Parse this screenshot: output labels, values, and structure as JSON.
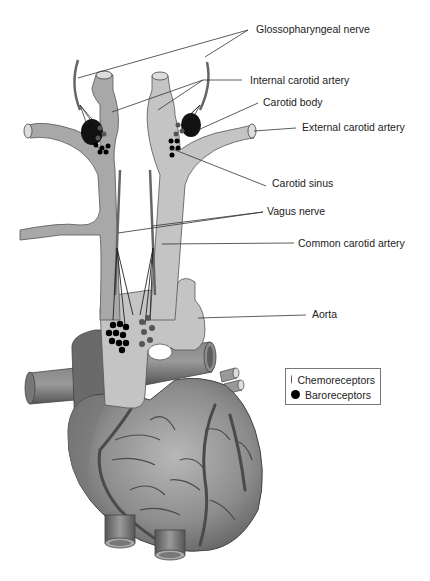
{
  "labels": {
    "glossopharyngeal": "Glossopharyngeal nerve",
    "internal_carotid": "Internal carotid artery",
    "carotid_body": "Carotid body",
    "external_carotid": "External carotid artery",
    "carotid_sinus": "Carotid sinus",
    "vagus": "Vagus nerve",
    "common_carotid": "Common carotid artery",
    "aorta": "Aorta"
  },
  "legend": {
    "items": [
      {
        "label": "Chemoreceptors",
        "color": "#555555"
      },
      {
        "label": "Baroreceptors",
        "color": "#000000"
      }
    ]
  },
  "colors": {
    "artery_left": "#a8a8a8",
    "artery_right": "#c4c4c4",
    "nerve": "#666666",
    "heart": "#8a8a8a",
    "vessel_dark": "#6e6e6e",
    "leader_line": "#333333"
  }
}
